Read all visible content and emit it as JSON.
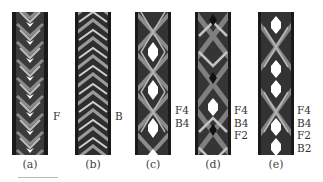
{
  "figure": {
    "panels": [
      {
        "id": "a",
        "caption": "(a)",
        "labels": [
          "F"
        ],
        "pattern": "chevron-fine"
      },
      {
        "id": "b",
        "caption": "(b)",
        "labels": [
          "B"
        ],
        "pattern": "chevron-dense"
      },
      {
        "id": "c",
        "caption": "(c)",
        "labels": [
          "F4",
          "B4"
        ],
        "pattern": "diamond-holes"
      },
      {
        "id": "d",
        "caption": "(d)",
        "labels": [
          "F4",
          "B4",
          "F2"
        ],
        "pattern": "x-diamond"
      },
      {
        "id": "e",
        "caption": "(e)",
        "labels": [
          "F4",
          "B4",
          "F2",
          "B2"
        ],
        "pattern": "paired-holes"
      }
    ]
  }
}
